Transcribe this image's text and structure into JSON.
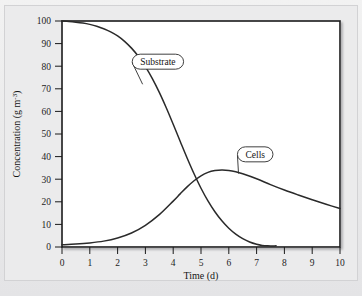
{
  "figure": {
    "background_color": "#ebebec",
    "plot_background_color": "#ffffff",
    "frame_color": "#1a1a1a",
    "curve_color": "#2a2a2a"
  },
  "chart_data": {
    "type": "line",
    "title": "",
    "subtitle": "",
    "xlabel": "Time (d)",
    "ylabel": "Concentration (g m",
    "ylabel_exponent": "-3",
    "ylabel_suffix": ")",
    "xlim": [
      0,
      10
    ],
    "ylim": [
      0,
      100
    ],
    "xticks": [
      "0",
      "1",
      "2",
      "3",
      "4",
      "5",
      "6",
      "7",
      "8",
      "9",
      "10"
    ],
    "xtick_values": [
      0,
      1,
      2,
      3,
      4,
      5,
      6,
      7,
      8,
      9,
      10
    ],
    "yticks": [
      "0",
      "10",
      "20",
      "30",
      "40",
      "50",
      "60",
      "70",
      "80",
      "90",
      "100"
    ],
    "ytick_values": [
      0,
      10,
      20,
      30,
      40,
      50,
      60,
      70,
      80,
      90,
      100
    ],
    "grid": false,
    "legend_position": "inline-callout",
    "series": [
      {
        "name": "Substrate",
        "label_position": {
          "x": 3.45,
          "y": 82
        },
        "anchor_point": {
          "x": 2.9,
          "y": 72
        },
        "x": [
          0,
          0.25,
          0.5,
          0.75,
          1.0,
          1.25,
          1.5,
          1.75,
          2.0,
          2.25,
          2.5,
          2.75,
          3.0,
          3.25,
          3.5,
          3.75,
          4.0,
          4.25,
          4.5,
          4.75,
          5.0,
          5.25,
          5.5,
          5.75,
          6.0,
          6.25,
          6.5,
          6.75,
          7.0,
          7.2,
          7.4,
          7.7
        ],
        "values": [
          100,
          99.8,
          99.5,
          99.1,
          98.5,
          97.7,
          96.6,
          95.2,
          93.4,
          91.0,
          88.0,
          84.3,
          79.8,
          74.5,
          68.4,
          61.6,
          54.3,
          46.8,
          39.4,
          32.4,
          26.0,
          20.4,
          15.6,
          11.6,
          8.3,
          5.7,
          3.7,
          2.2,
          1.2,
          0.7,
          0.5,
          0.5
        ]
      },
      {
        "name": "Cells",
        "label_position": {
          "x": 6.95,
          "y": 41
        },
        "anchor_point": {
          "x": 6.35,
          "y": 32.5
        },
        "x": [
          0,
          0.5,
          1.0,
          1.5,
          2.0,
          2.5,
          3.0,
          3.5,
          4.0,
          4.25,
          4.5,
          4.75,
          5.0,
          5.25,
          5.5,
          5.75,
          6.0,
          6.25,
          6.5,
          7.0,
          7.5,
          8.0,
          8.5,
          9.0,
          9.5,
          10.0
        ],
        "values": [
          1.0,
          1.3,
          1.8,
          2.6,
          4.0,
          6.2,
          9.6,
          14.3,
          20.3,
          23.5,
          26.6,
          29.3,
          31.5,
          33.0,
          33.8,
          34.1,
          33.9,
          33.3,
          32.4,
          30.2,
          27.6,
          25.2,
          23.0,
          20.9,
          18.9,
          17.0
        ]
      }
    ]
  }
}
